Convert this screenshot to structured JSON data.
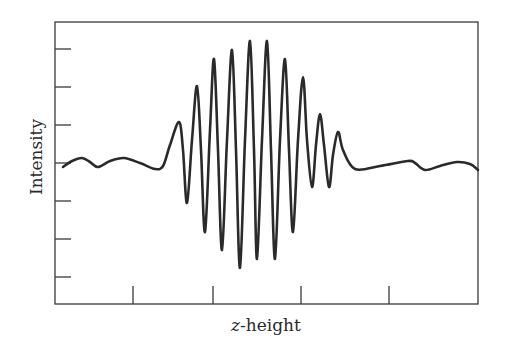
{
  "chart_data": {
    "type": "line",
    "title": "",
    "xlabel": "z-height",
    "xlabel_italic_part": "z",
    "xlabel_rest": "-height",
    "ylabel": "Intensity",
    "x_ticks": 4,
    "y_ticks": 7,
    "tick_labels": [],
    "grid": false,
    "legend": null,
    "series": [
      {
        "name": "intensity",
        "color": "#2a2a2a",
        "points_px": [
          [
            63,
            167
          ],
          [
            72,
            161
          ],
          [
            82,
            158
          ],
          [
            90,
            162
          ],
          [
            98,
            167
          ],
          [
            110,
            161
          ],
          [
            124,
            158
          ],
          [
            140,
            163
          ],
          [
            155,
            169
          ],
          [
            163,
            166
          ],
          [
            170,
            145
          ],
          [
            179,
            122
          ],
          [
            183,
            150
          ],
          [
            187,
            203
          ],
          [
            192,
            140
          ],
          [
            197,
            86
          ],
          [
            201,
            150
          ],
          [
            205,
            232
          ],
          [
            210,
            130
          ],
          [
            214,
            59
          ],
          [
            218,
            150
          ],
          [
            222,
            250
          ],
          [
            227,
            140
          ],
          [
            232,
            50
          ],
          [
            236,
            150
          ],
          [
            240,
            268
          ],
          [
            245,
            140
          ],
          [
            250,
            41
          ],
          [
            254,
            150
          ],
          [
            257,
            259
          ],
          [
            262,
            140
          ],
          [
            267,
            41
          ],
          [
            271,
            150
          ],
          [
            275,
            259
          ],
          [
            280,
            140
          ],
          [
            285,
            59
          ],
          [
            289,
            150
          ],
          [
            293,
            232
          ],
          [
            298,
            140
          ],
          [
            303,
            77
          ],
          [
            307,
            140
          ],
          [
            312,
            187
          ],
          [
            316,
            145
          ],
          [
            320,
            114
          ],
          [
            324,
            145
          ],
          [
            329,
            187
          ],
          [
            333,
            155
          ],
          [
            338,
            132
          ],
          [
            343,
            150
          ],
          [
            355,
            169
          ],
          [
            380,
            166
          ],
          [
            408,
            161
          ],
          [
            415,
            163
          ],
          [
            425,
            170
          ],
          [
            440,
            166
          ],
          [
            457,
            162
          ],
          [
            470,
            164
          ],
          [
            478,
            170
          ]
        ],
        "peaks": [
          {
            "x_px": 179,
            "y_px": 122
          },
          {
            "x_px": 197,
            "y_px": 86
          },
          {
            "x_px": 214,
            "y_px": 59
          },
          {
            "x_px": 232,
            "y_px": 50
          },
          {
            "x_px": 250,
            "y_px": 41
          },
          {
            "x_px": 267,
            "y_px": 41
          },
          {
            "x_px": 285,
            "y_px": 59
          },
          {
            "x_px": 303,
            "y_px": 77
          },
          {
            "x_px": 320,
            "y_px": 114
          },
          {
            "x_px": 338,
            "y_px": 132
          }
        ],
        "troughs": [
          {
            "x_px": 187,
            "y_px": 203
          },
          {
            "x_px": 205,
            "y_px": 232
          },
          {
            "x_px": 222,
            "y_px": 250
          },
          {
            "x_px": 240,
            "y_px": 268
          },
          {
            "x_px": 257,
            "y_px": 259
          },
          {
            "x_px": 275,
            "y_px": 259
          },
          {
            "x_px": 293,
            "y_px": 232
          },
          {
            "x_px": 312,
            "y_px": 187
          },
          {
            "x_px": 329,
            "y_px": 187
          }
        ]
      }
    ],
    "layout": {
      "plot_left": 55,
      "plot_top": 22,
      "plot_right": 478,
      "plot_bottom": 304,
      "y_tick_positions_px": [
        49,
        87,
        125,
        163,
        201,
        239,
        277
      ],
      "x_tick_positions_px": [
        133,
        213,
        301,
        389
      ],
      "y_tick_length": 16,
      "x_tick_length": 18
    }
  }
}
